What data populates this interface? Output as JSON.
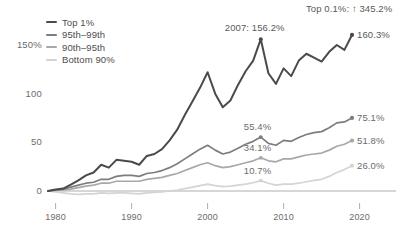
{
  "chart_data": {
    "type": "line",
    "title": "",
    "xlabel": "",
    "ylabel": "",
    "xlim": [
      1979,
      2021
    ],
    "ylim": [
      -8,
      170
    ],
    "grid": false,
    "legend_position": "top-left",
    "y_ticks": [
      {
        "value": 0,
        "label": "0"
      },
      {
        "value": 50,
        "label": "50"
      },
      {
        "value": 100,
        "label": "100"
      },
      {
        "value": 150,
        "label": "150%"
      }
    ],
    "x_ticks": [
      {
        "value": 1980,
        "label": "1980"
      },
      {
        "value": 1990,
        "label": "1990"
      },
      {
        "value": 2000,
        "label": "2000"
      },
      {
        "value": 2010,
        "label": "2010"
      },
      {
        "value": 2020,
        "label": "2020"
      }
    ],
    "x": [
      1979,
      1980,
      1981,
      1982,
      1983,
      1984,
      1985,
      1986,
      1987,
      1988,
      1989,
      1990,
      1991,
      1992,
      1993,
      1994,
      1995,
      1996,
      1997,
      1998,
      1999,
      2000,
      2001,
      2002,
      2003,
      2004,
      2005,
      2006,
      2007,
      2008,
      2009,
      2010,
      2011,
      2012,
      2013,
      2014,
      2015,
      2016,
      2017,
      2018,
      2019
    ],
    "series": [
      {
        "name": "Top 1%",
        "color": "#4a4a4a",
        "values": [
          0,
          1.5,
          2.5,
          6.5,
          11,
          16,
          19,
          27,
          24,
          32,
          31,
          30,
          27,
          36,
          38,
          43,
          52,
          63,
          78,
          92,
          106,
          122,
          100,
          86,
          93,
          109,
          123,
          134,
          156,
          121,
          110,
          126,
          118,
          134,
          141,
          137,
          133,
          143,
          150,
          145,
          160.3
        ],
        "end_label": "160.3%",
        "end_value": 160.3
      },
      {
        "name": "95th–99th",
        "color": "#7d7d7d",
        "values": [
          0,
          1,
          2,
          4,
          6,
          8,
          9,
          12,
          12,
          15,
          16,
          16,
          15,
          18,
          19,
          21,
          24,
          28,
          33,
          38,
          43,
          47,
          42,
          38,
          40,
          44,
          48,
          51,
          55.4,
          49,
          47,
          52,
          51,
          55,
          58,
          60,
          61,
          65,
          70,
          71,
          75.1
        ],
        "mid_label": "55.4%",
        "mid_year": 2007,
        "mid_value": 55.4,
        "end_label": "75.1%",
        "end_value": 75.1
      },
      {
        "name": "90th–95th",
        "color": "#a8a8a8",
        "values": [
          0,
          0.5,
          1,
          2,
          3.5,
          5,
          6,
          8,
          8,
          10,
          10,
          10,
          10,
          12,
          13,
          14,
          16,
          18,
          21,
          24,
          27,
          29,
          26,
          24,
          25,
          27,
          29,
          31,
          34.1,
          31,
          30,
          33,
          33,
          35,
          37,
          38,
          39,
          42,
          46,
          48,
          51.8
        ],
        "mid_label": "34.1%",
        "mid_year": 2007,
        "mid_value": 34.1,
        "end_label": "51.8%",
        "end_value": 51.8
      },
      {
        "name": "Bottom 90%",
        "color": "#d4d4d4",
        "values": [
          0,
          -1,
          -2,
          -3,
          -3.5,
          -3,
          -3,
          -2,
          -2.5,
          -2,
          -2,
          -2.5,
          -3,
          -2,
          -1.5,
          -1,
          0,
          1,
          2.5,
          4,
          5.5,
          7,
          5.5,
          4.5,
          5,
          6,
          7,
          8.5,
          10.7,
          8,
          6,
          7,
          7,
          8,
          9.5,
          11,
          12,
          15,
          19,
          22,
          26.0
        ],
        "mid_label": "10.7%",
        "mid_year": 2007,
        "mid_value": 10.7,
        "end_label": "26.0%",
        "end_value": 26.0
      }
    ],
    "annotations": [
      {
        "name": "peak-2007",
        "text": "2007: 156.2%",
        "year": 2007,
        "value": 156.2,
        "series": "Top 1%"
      },
      {
        "name": "top-point-one-percent",
        "text": "Top 0.1%: ↑ 345.2%"
      }
    ]
  }
}
